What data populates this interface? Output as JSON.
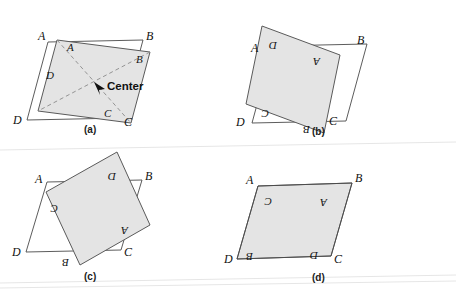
{
  "figure": {
    "title_fragment_top": "",
    "background_color": "#ffffff",
    "shade_color": "#e4e4e4",
    "outline_color": "#4a4a4a",
    "shaded_stroke_color": "#5a5a5a",
    "dashed_color": "#8a8a8a",
    "panels": [
      {
        "id": "a",
        "caption": "(a)",
        "caption_pos": {
          "x": 84,
          "y": 124
        },
        "outline_label_A": "A",
        "outline_label_B": "B",
        "outline_label_C": "C",
        "outline_label_D": "D",
        "inner_label_A": "A",
        "inner_label_B": "B",
        "inner_label_C": "C",
        "inner_label_D": "D",
        "center_label": "Center",
        "rotation_deg": 0,
        "has_diagonals": true,
        "has_center_arrow": true
      },
      {
        "id": "b",
        "caption": "(b)",
        "caption_pos": {
          "x": 312,
          "y": 126
        },
        "outline_label_A": "A",
        "outline_label_B": "B",
        "outline_label_C": "C",
        "outline_label_D": "D",
        "inner_label_A": "A",
        "inner_label_B": "B",
        "inner_label_C": "C",
        "inner_label_D": "D",
        "rotation_deg": 180,
        "has_diagonals": false,
        "has_center_arrow": false
      },
      {
        "id": "c",
        "caption": "(c)",
        "caption_pos": {
          "x": 84,
          "y": 271
        },
        "outline_label_A": "A",
        "outline_label_B": "B",
        "outline_label_C": "C",
        "outline_label_D": "D",
        "inner_label_A": "A",
        "inner_label_B": "B",
        "inner_label_C": "C",
        "inner_label_D": "D",
        "rotation_deg": 180,
        "has_diagonals": false,
        "has_center_arrow": false
      },
      {
        "id": "d",
        "caption": "(d)",
        "caption_pos": {
          "x": 312,
          "y": 272
        },
        "outline_label_A": "A",
        "outline_label_B": "B",
        "outline_label_C": "C",
        "outline_label_D": "D",
        "inner_label_A": "A",
        "inner_label_B": "B",
        "inner_label_C": "C",
        "inner_label_D": "D",
        "rotation_deg": 180,
        "has_diagonals": false,
        "has_center_arrow": false
      }
    ]
  }
}
